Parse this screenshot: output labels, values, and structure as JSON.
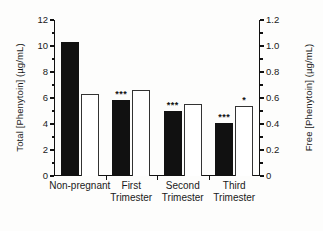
{
  "chart_data": {
    "type": "bar",
    "title": "",
    "categories": [
      "Non-pregnant",
      "First\nTrimester",
      "Second\nTrimester",
      "Third\nTrimester"
    ],
    "series": [
      {
        "name": "Total [Phenytoin]",
        "axis": "left",
        "fill": "solid-black",
        "values": [
          10.3,
          5.85,
          5.0,
          4.1
        ],
        "annotations": [
          "",
          "***",
          "***",
          "***"
        ]
      },
      {
        "name": "Free [Phenytoin]",
        "axis": "right",
        "fill": "open-white",
        "values": [
          0.63,
          0.665,
          0.555,
          0.54
        ],
        "annotations": [
          "",
          "",
          "",
          "*"
        ]
      }
    ],
    "xlabel": "",
    "ylabel": "Total [Phenytoin] (µg/mL)",
    "ylabel_right": "Free [Phenytoin] (µg/mL)",
    "ylim": [
      0,
      12
    ],
    "ylim_right": [
      0,
      1.2
    ],
    "yticks": [
      "0",
      "2",
      "4",
      "6",
      "8",
      "10",
      "12"
    ],
    "yticks_right": [
      "0",
      "0.2",
      "0.4",
      "0.6",
      "0.8",
      "1.0",
      "1.2"
    ],
    "grid": false,
    "legend": "none"
  },
  "axes": {
    "left_title": "Total [Phenytoin] (µg/mL)",
    "right_title": "Free [Phenytoin] (µg/mL)",
    "left_ticks": [
      "12",
      "10",
      "8",
      "6",
      "4",
      "2",
      "0"
    ],
    "right_ticks": [
      "1.2",
      "1.0",
      "0.8",
      "0.6",
      "0.4",
      "0.2",
      "0"
    ]
  },
  "groups": [
    {
      "label": "Non-pregnant",
      "total": 10.3,
      "free": 0.63,
      "total_sig": "",
      "free_sig": ""
    },
    {
      "label": "First\nTrimester",
      "total": 5.85,
      "free": 0.665,
      "total_sig": "***",
      "free_sig": ""
    },
    {
      "label": "Second\nTrimester",
      "total": 5.0,
      "free": 0.555,
      "total_sig": "***",
      "free_sig": ""
    },
    {
      "label": "Third\nTrimester",
      "total": 4.1,
      "free": 0.54,
      "total_sig": "***",
      "free_sig": "*"
    }
  ],
  "colors": {
    "total_bar": "#111111",
    "free_bar_stroke": "#333333",
    "free_bar_fill": "#ffffff",
    "axis": "#111111",
    "text": "#1a1a1a",
    "background": "#ffffff"
  }
}
